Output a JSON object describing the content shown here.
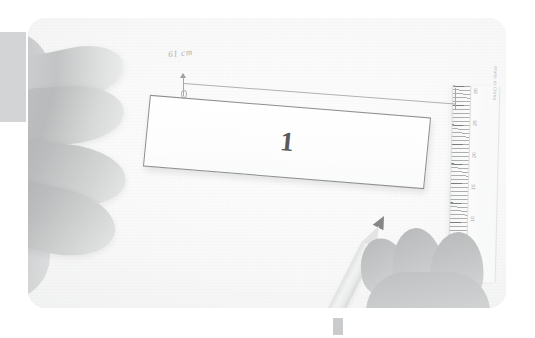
{
  "scene": {
    "title": "Measuring a paper strip",
    "description": "Overhead photo of two hands on a light worktable: the left hand steadies a white paper strip labelled 1, the right hand holds a pencil, and a transparent ruler lies along the right edge."
  },
  "photo": {
    "strip": {
      "label": "1",
      "name": "paper-strip"
    },
    "dimension": {
      "handwritten_label": "61 cm",
      "name": "dimension-line"
    },
    "ruler": {
      "brand_text": "Made in China",
      "tick_numbers": [
        "30",
        "25",
        "20",
        "15",
        "10",
        "5"
      ],
      "unit": "cm"
    },
    "pencil": {
      "name": "pencil"
    },
    "hands": {
      "left_name": "left-hand",
      "right_name": "right-hand"
    }
  },
  "overlay": {
    "left_block_label": "",
    "bottom_marker_label": ""
  },
  "colors": {
    "surface": "#f6f6f6",
    "strip_fill": "#ffffff",
    "strip_stroke": "#5c5f61",
    "ink": "#111315",
    "pencil_tip": "#4f5254",
    "overlay_gray": "#d3d4d5"
  }
}
